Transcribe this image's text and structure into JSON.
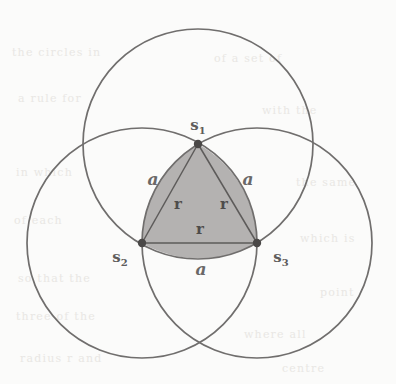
{
  "figure": {
    "background_color": "#fbfbfa",
    "stroke_color": "#706e6d",
    "fill_color": "#b4b2b1",
    "vertex_dot_color": "#4a4847",
    "circle_count": 3,
    "radius_px": 115
  },
  "vertices": [
    {
      "id": "s1",
      "label": "s",
      "subscript": "1",
      "x": 198,
      "y": 144,
      "label_x": 198,
      "label_y": 130,
      "label_anchor": "middle"
    },
    {
      "id": "s2",
      "label": "s",
      "subscript": "2",
      "x": 142,
      "y": 243,
      "label_x": 120,
      "label_y": 262,
      "label_anchor": "middle"
    },
    {
      "id": "s3",
      "label": "s",
      "subscript": "3",
      "x": 257,
      "y": 243,
      "label_x": 281,
      "label_y": 262,
      "label_anchor": "middle"
    }
  ],
  "circles": [
    {
      "id": "circle-top",
      "center_x": 198,
      "center_y": 144,
      "r": 115
    },
    {
      "id": "circle-left",
      "center_x": 142,
      "center_y": 243,
      "r": 115
    },
    {
      "id": "circle-right",
      "center_x": 257,
      "center_y": 243,
      "r": 115
    }
  ],
  "side_labels": [
    {
      "id": "side-left",
      "text": "a",
      "x": 153,
      "y": 185
    },
    {
      "id": "side-right",
      "text": "a",
      "x": 248,
      "y": 185
    },
    {
      "id": "side-bottom",
      "text": "a",
      "x": 201,
      "y": 275
    }
  ],
  "radius_labels": [
    {
      "id": "radius-left",
      "text": "r",
      "x": 178,
      "y": 209
    },
    {
      "id": "radius-right",
      "text": "r",
      "x": 224,
      "y": 209
    },
    {
      "id": "radius-bottom",
      "text": "r",
      "x": 200,
      "y": 234
    }
  ],
  "chords": [
    {
      "id": "chord-s1-s2",
      "x1": 198,
      "y1": 144,
      "x2": 142,
      "y2": 243
    },
    {
      "id": "chord-s1-s3",
      "x1": 198,
      "y1": 144,
      "x2": 257,
      "y2": 243
    },
    {
      "id": "chord-s2-s3",
      "x1": 142,
      "y1": 243,
      "x2": 257,
      "y2": 243
    }
  ],
  "shaded_region": {
    "id": "reuleaux-triangle",
    "path": "M 198 144 A 115 115 0 0 1 257 243 A 115 115 0 0 1 142 243 A 115 115 0 0 1 198 144 Z"
  },
  "bleed_through": [
    {
      "text": "the  circles  in",
      "x": 12,
      "y": 46
    },
    {
      "text": "of  a  set  of",
      "x": 214,
      "y": 52
    },
    {
      "text": "a  rule  for",
      "x": 18,
      "y": 92
    },
    {
      "text": "with  the",
      "x": 262,
      "y": 104
    },
    {
      "text": "in  which",
      "x": 16,
      "y": 166
    },
    {
      "text": "the  same",
      "x": 296,
      "y": 176
    },
    {
      "text": "of  each",
      "x": 14,
      "y": 214
    },
    {
      "text": "which  is",
      "x": 300,
      "y": 232
    },
    {
      "text": "so  that  the",
      "x": 18,
      "y": 272
    },
    {
      "text": "point",
      "x": 320,
      "y": 286
    },
    {
      "text": "three  of  the",
      "x": 16,
      "y": 310
    },
    {
      "text": "where  all",
      "x": 244,
      "y": 328
    },
    {
      "text": "radius  r  and",
      "x": 20,
      "y": 352
    },
    {
      "text": "centre",
      "x": 282,
      "y": 362
    }
  ]
}
